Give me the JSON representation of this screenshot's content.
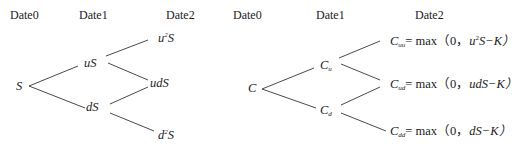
{
  "stock_tree": {
    "headers": [
      "Date0",
      "Date1",
      "Date2"
    ],
    "nodes": {
      "root": "S",
      "up": "uS",
      "down": "dS",
      "upup_base": "u",
      "upup_exp": "2",
      "upup_tail": "S",
      "updown": "udS",
      "downdown_base": "d",
      "downdown_exp": "2",
      "downdown_tail": "S"
    }
  },
  "option_tree": {
    "headers": [
      "Date0",
      "Date1",
      "Date2"
    ],
    "nodes": {
      "root": "C",
      "up_base": "C",
      "up_sub": "u",
      "down_base": "C",
      "down_sub": "d",
      "uu": {
        "base": "C",
        "sub": "uu",
        "eq": "= max（0，",
        "arg_pre": "u",
        "arg_exp": "2",
        "arg_post": "S−K）"
      },
      "ud": {
        "base": "C",
        "sub": "ud",
        "eq": "= max（0，",
        "arg_pre": "udS−K）",
        "arg_exp": "",
        "arg_post": ""
      },
      "dd": {
        "base": "C",
        "sub": "dd",
        "eq": "= max（0，",
        "arg_pre": "dS−K）",
        "arg_exp": "",
        "arg_post": ""
      }
    }
  }
}
